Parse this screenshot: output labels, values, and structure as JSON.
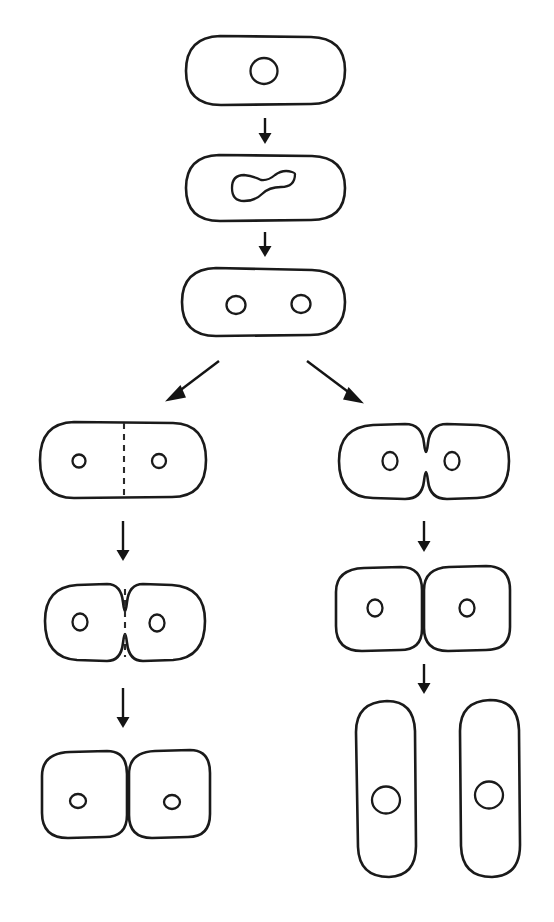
{
  "diagram": {
    "title": "Bacterial cell division (binary fission) pathways",
    "canvas": {
      "width": 554,
      "height": 922,
      "background": "#ffffff"
    },
    "stroke_color": "#1a1a1a",
    "arrow_color": "#141414",
    "dashed_septum_color": "#2a2a2a",
    "stages": [
      {
        "id": "stage-1-single-cell",
        "label": "Single rod-shaped cell with one nucleoid",
        "shape": "rounded-rod-horizontal",
        "nuclei": 1,
        "septum": "none",
        "x": 186,
        "y": 36,
        "width": 159,
        "height": 69
      },
      {
        "id": "stage-2-dividing-nucleoid",
        "label": "Cell with dumbbell-shaped dividing nucleoid",
        "shape": "rounded-rod-horizontal",
        "nuclei": 1,
        "nucleus_shape": "dumbbell",
        "septum": "none",
        "x": 186,
        "y": 155,
        "width": 159,
        "height": 66
      },
      {
        "id": "stage-3-two-nucleoids",
        "label": "Cell with two separated nucleoids",
        "shape": "rounded-rod-horizontal",
        "nuclei": 2,
        "septum": "none",
        "x": 182,
        "y": 268,
        "width": 163,
        "height": 68
      },
      {
        "id": "left-stage-1-septum-forming",
        "label": "Septum forming across cell, cell wall still straight",
        "branch": "left",
        "shape": "rounded-rod-horizontal",
        "nuclei": 2,
        "septum": "dashed-straight",
        "x": 40,
        "y": 422,
        "width": 166,
        "height": 76
      },
      {
        "id": "left-stage-2-constricting",
        "label": "Cell constricting at septum, dashed division plane visible",
        "branch": "left",
        "shape": "pinched-pair",
        "nuclei": 2,
        "septum": "dashed-pinched",
        "x": 45,
        "y": 583,
        "width": 160,
        "height": 78
      },
      {
        "id": "left-stage-3-daughter-cells",
        "label": "Two attached daughter cells, septum complete",
        "branch": "left",
        "shape": "two-adjacent-rounded-squares",
        "nuclei": 2,
        "septum": "solid-complete",
        "x": 42,
        "y": 750,
        "width": 168,
        "height": 88
      },
      {
        "id": "right-stage-1-constricting",
        "label": "Cell constricting by pinching, no septum plate",
        "branch": "right",
        "shape": "pinched-pair",
        "nuclei": 2,
        "septum": "none",
        "x": 339,
        "y": 423,
        "width": 170,
        "height": 78
      },
      {
        "id": "right-stage-2-daughter-cells",
        "label": "Two attached daughter cells after constriction",
        "branch": "right",
        "shape": "two-adjacent-rounded-squares",
        "nuclei": 2,
        "septum": "solid-complete",
        "x": 336,
        "y": 566,
        "width": 174,
        "height": 84
      },
      {
        "id": "right-stage-3-separated-cells",
        "label": "Two fully separated rod-shaped daughter cells",
        "branch": "right",
        "shape": "two-separated-rods-vertical",
        "nuclei": 2,
        "septum": "separated",
        "x": 355,
        "y": 700,
        "width": 175,
        "height": 178
      }
    ],
    "arrows": [
      {
        "id": "arrow-1",
        "type": "vertical-down",
        "from_stage": "stage-1-single-cell",
        "to_stage": "stage-2-dividing-nucleoid",
        "x": 265,
        "y1": 118,
        "y2": 143
      },
      {
        "id": "arrow-2",
        "type": "vertical-down",
        "from_stage": "stage-2-dividing-nucleoid",
        "to_stage": "stage-3-two-nucleoids",
        "x": 265,
        "y1": 232,
        "y2": 257
      },
      {
        "id": "arrow-3-branch-left",
        "type": "diagonal-down-left",
        "from_stage": "stage-3-two-nucleoids",
        "to_stage": "left-stage-1-septum-forming",
        "x1": 219,
        "y1": 361,
        "x2": 167,
        "y2": 400
      },
      {
        "id": "arrow-4-branch-right",
        "type": "diagonal-down-right",
        "from_stage": "stage-3-two-nucleoids",
        "to_stage": "right-stage-1-constricting",
        "x1": 307,
        "y1": 361,
        "x2": 362,
        "y2": 402
      },
      {
        "id": "arrow-5-left",
        "type": "vertical-down",
        "from_stage": "left-stage-1-septum-forming",
        "to_stage": "left-stage-2-constricting",
        "x": 123,
        "y1": 521,
        "y2": 561
      },
      {
        "id": "arrow-6-left",
        "type": "vertical-down",
        "from_stage": "left-stage-2-constricting",
        "to_stage": "left-stage-3-daughter-cells",
        "x": 123,
        "y1": 688,
        "y2": 728
      },
      {
        "id": "arrow-7-right",
        "type": "vertical-down",
        "from_stage": "right-stage-1-constricting",
        "to_stage": "right-stage-2-daughter-cells",
        "x": 424,
        "y1": 521,
        "y2": 552
      },
      {
        "id": "arrow-8-right",
        "type": "vertical-down",
        "from_stage": "right-stage-2-daughter-cells",
        "to_stage": "right-stage-3-separated-cells",
        "x": 424,
        "y1": 664,
        "y2": 694
      }
    ]
  }
}
